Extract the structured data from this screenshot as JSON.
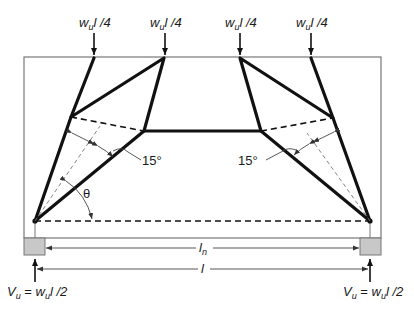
{
  "figure": {
    "type": "strut-and-tie model of deep beam",
    "loads": [
      {
        "label_base": "w",
        "label_sub": "u",
        "label_rest": "l /4",
        "x": 94
      },
      {
        "label_base": "w",
        "label_sub": "u",
        "label_rest": "l /4",
        "x": 165
      },
      {
        "label_base": "w",
        "label_sub": "u",
        "label_rest": "l /4",
        "x": 240
      },
      {
        "label_base": "w",
        "label_sub": "u",
        "label_rest": "l /4",
        "x": 311
      }
    ],
    "angles": {
      "left_spread": "15°",
      "right_spread": "15°",
      "theta": "θ"
    },
    "dimensions": {
      "clear_span": {
        "base": "l",
        "sub": "n"
      },
      "span": {
        "base": "l",
        "sub": ""
      }
    },
    "reactions": {
      "left": {
        "lhs_base": "V",
        "lhs_sub": "u",
        "eq": " = ",
        "rhs_base": "w",
        "rhs_sub": "u",
        "rhs_rest": "l /2"
      },
      "right": {
        "lhs_base": "V",
        "lhs_sub": "u",
        "eq": " = ",
        "rhs_base": "w",
        "rhs_sub": "u",
        "rhs_rest": "l /2"
      }
    },
    "colors": {
      "strut": "#111111",
      "beam_outline": "#777777",
      "support_fill": "#c8c8c8"
    }
  }
}
